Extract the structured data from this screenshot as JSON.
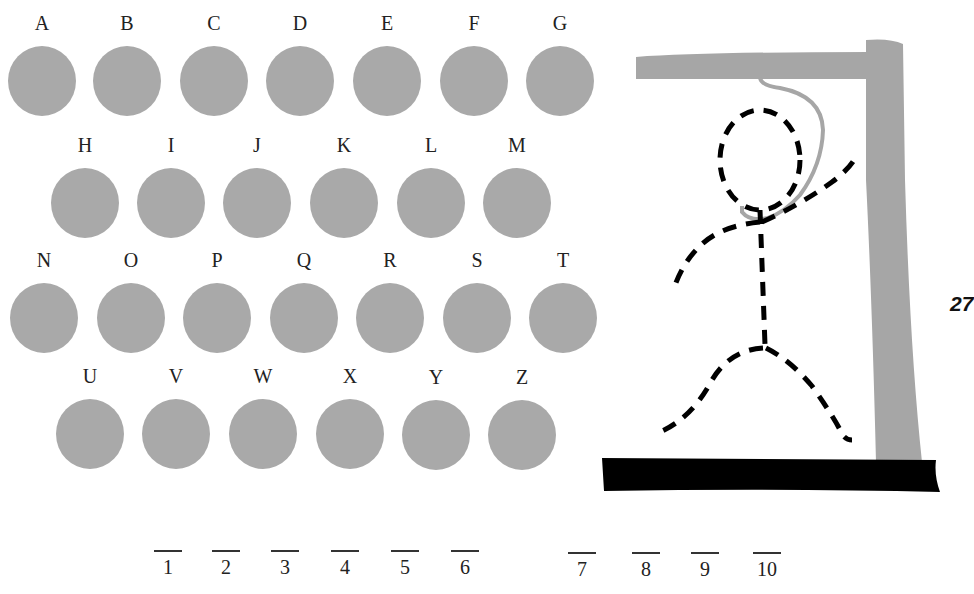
{
  "game": {
    "title": "Hangman",
    "page_number": "27",
    "colors": {
      "circle": "#a9a9a9",
      "gallows": "#a6a6a6",
      "base": "#000000",
      "figure": "#000000"
    }
  },
  "letters": [
    {
      "label": "A",
      "x": 8,
      "y": 46
    },
    {
      "label": "B",
      "x": 93,
      "y": 46
    },
    {
      "label": "C",
      "x": 180,
      "y": 46
    },
    {
      "label": "D",
      "x": 266,
      "y": 46
    },
    {
      "label": "E",
      "x": 353,
      "y": 46
    },
    {
      "label": "F",
      "x": 440,
      "y": 46
    },
    {
      "label": "G",
      "x": 526,
      "y": 46
    },
    {
      "label": "H",
      "x": 51,
      "y": 168
    },
    {
      "label": "I",
      "x": 137,
      "y": 168
    },
    {
      "label": "J",
      "x": 223,
      "y": 168
    },
    {
      "label": "K",
      "x": 310,
      "y": 168
    },
    {
      "label": "L",
      "x": 397,
      "y": 168
    },
    {
      "label": "M",
      "x": 483,
      "y": 168
    },
    {
      "label": "N",
      "x": 10,
      "y": 283
    },
    {
      "label": "O",
      "x": 97,
      "y": 283
    },
    {
      "label": "P",
      "x": 183,
      "y": 283
    },
    {
      "label": "Q",
      "x": 270,
      "y": 283
    },
    {
      "label": "R",
      "x": 356,
      "y": 283
    },
    {
      "label": "S",
      "x": 443,
      "y": 283
    },
    {
      "label": "T",
      "x": 529,
      "y": 283
    },
    {
      "label": "U",
      "x": 56,
      "y": 399
    },
    {
      "label": "V",
      "x": 142,
      "y": 399
    },
    {
      "label": "W",
      "x": 229,
      "y": 399
    },
    {
      "label": "X",
      "x": 316,
      "y": 399
    },
    {
      "label": "Y",
      "x": 402,
      "y": 400
    },
    {
      "label": "Z",
      "x": 488,
      "y": 400
    }
  ],
  "answer_slots": [
    {
      "number": "1",
      "x": 153
    },
    {
      "number": "2",
      "x": 211
    },
    {
      "number": "3",
      "x": 270
    },
    {
      "number": "4",
      "x": 330
    },
    {
      "number": "5",
      "x": 390
    },
    {
      "number": "6",
      "x": 450
    },
    {
      "number": "7",
      "x": 567
    },
    {
      "number": "8",
      "x": 631
    },
    {
      "number": "9",
      "x": 690
    },
    {
      "number": "10",
      "x": 752
    }
  ]
}
